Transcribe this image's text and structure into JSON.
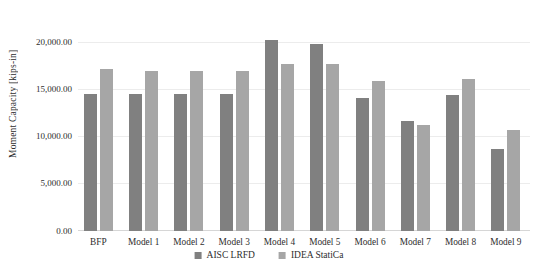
{
  "chart_data": {
    "type": "bar",
    "ylabel": "Moment Capacity [kips-in]",
    "xlabel": "",
    "categories": [
      "BFP",
      "Model 1",
      "Model 2",
      "Model 3",
      "Model 4",
      "Model 5",
      "Model 6",
      "Model 7",
      "Model 8",
      "Model 9"
    ],
    "series": [
      {
        "name": "AISC LRFD",
        "color": "#808080",
        "values": [
          14550,
          14550,
          14550,
          14550,
          20300,
          19850,
          14150,
          11650,
          14400,
          8700
        ]
      },
      {
        "name": "IDEA StatiCa",
        "color": "#a6a6a6",
        "values": [
          17150,
          17000,
          17000,
          17000,
          17750,
          17750,
          15950,
          11300,
          16150,
          10700
        ]
      }
    ],
    "y_axis": {
      "min": 0,
      "max": 20000,
      "tick_interval": 5000,
      "tick_labels": [
        "0.00",
        "5,000.00",
        "10,000.00",
        "15,000.00",
        "20,000.00"
      ]
    },
    "grid": "horizontal",
    "legend_position": "bottom"
  },
  "colors": {
    "background": "#ffffff",
    "gridline": "#ececec",
    "axis_line": "#d6d6d6",
    "text": "#2e2e2e"
  }
}
